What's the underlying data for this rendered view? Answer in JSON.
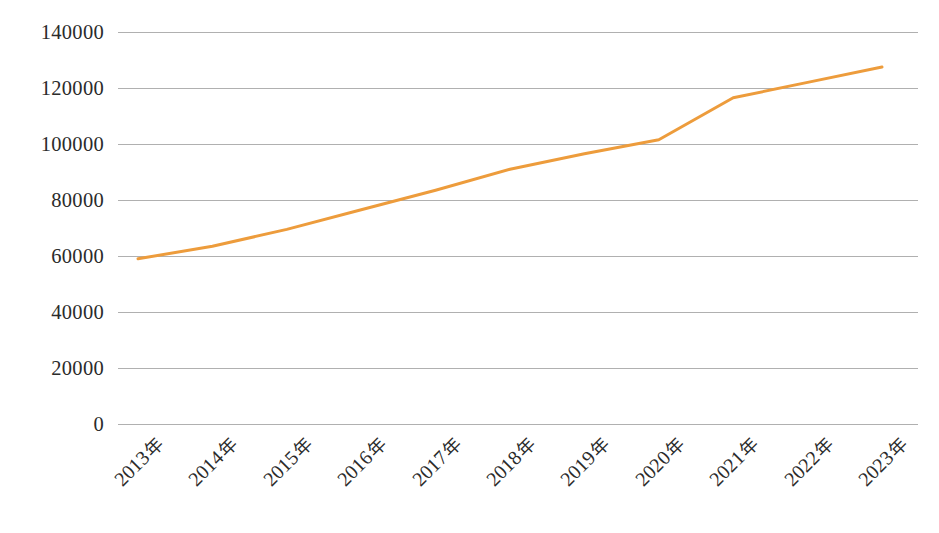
{
  "chart_data": {
    "type": "line",
    "title": "",
    "subtitle": "",
    "xlabel": "",
    "ylabel": "",
    "categories": [
      "2013 年",
      "2014 年",
      "2015 年",
      "2016 年",
      "2017 年",
      "2018 年",
      "2019 年",
      "2020 年",
      "2021 年",
      "2022 年",
      "2023 年"
    ],
    "series": [
      {
        "name": "系列1",
        "color": "#ED9C3C",
        "values": [
          59000,
          63500,
          69500,
          76500,
          83500,
          91000,
          96500,
          101500,
          116500,
          122000,
          127500
        ]
      }
    ],
    "ylim": [
      0,
      140000
    ],
    "yticks": [
      0,
      20000,
      40000,
      60000,
      80000,
      100000,
      120000,
      140000
    ],
    "ytick_labels": [
      "0",
      "20000",
      "40000",
      "60000",
      "80000",
      "100000",
      "120000",
      "140000"
    ],
    "grid": true,
    "grid_axis": "y",
    "legend": false,
    "legend_position": "none",
    "x_tick_rotation": -45,
    "markers": false,
    "line_width": 3
  },
  "colors": {
    "series_orange": "#ED9C3C",
    "gridline": "#b0b0b0",
    "text": "#2b2b2b",
    "background": "#ffffff"
  }
}
